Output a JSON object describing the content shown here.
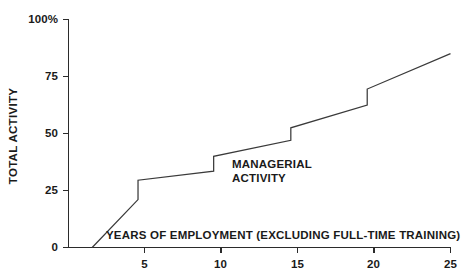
{
  "chart_data": {
    "type": "line",
    "title": "",
    "subtitle": "",
    "xlabel": "YEARS OF EMPLOYMENT (EXCLUDING FULL-TIME TRAINING)",
    "ylabel": "TOTAL ACTIVITY",
    "xlim": [
      0,
      25
    ],
    "ylim": [
      0,
      100
    ],
    "grid": false,
    "legend_position": "none",
    "x_ticks": [
      5,
      10,
      15,
      20,
      25
    ],
    "x_tick_labels": [
      "5",
      "10",
      "15",
      "20",
      "25"
    ],
    "y_ticks": [
      0,
      25,
      50,
      75,
      100
    ],
    "y_tick_labels": [
      "0",
      "25",
      "50",
      "75",
      "100%"
    ],
    "annotations": [
      {
        "name": "managerial-activity",
        "line1": "MANAGERIAL",
        "line2": "ACTIVITY",
        "x": 13.1,
        "y": 39
      }
    ],
    "series": [
      {
        "name": "Total activity step curve",
        "style": "step-with-ramps",
        "color": "#3a3a3a",
        "points": [
          {
            "x": 1.55,
            "y": 0
          },
          {
            "x": 4.55,
            "y": 21
          },
          {
            "x": 4.55,
            "y": 29.5
          },
          {
            "x": 9.5,
            "y": 33.5
          },
          {
            "x": 9.5,
            "y": 40
          },
          {
            "x": 14.55,
            "y": 47
          },
          {
            "x": 14.55,
            "y": 52.5
          },
          {
            "x": 19.55,
            "y": 62.5
          },
          {
            "x": 19.55,
            "y": 69.5
          },
          {
            "x": 25.0,
            "y": 85
          }
        ]
      }
    ]
  },
  "axis": {
    "y_labels": [
      "100%",
      "75",
      "50",
      "25",
      "0"
    ],
    "x_labels": [
      "5",
      "10",
      "15",
      "20",
      "25"
    ],
    "y_title": "TOTAL ACTIVITY",
    "x_title": "YEARS OF EMPLOYMENT (EXCLUDING FULL-TIME TRAINING)"
  },
  "annotation": {
    "line1": "MANAGERIAL",
    "line2": "ACTIVITY"
  },
  "colors": {
    "line": "#3a3a3a",
    "axis": "#2b2b2b",
    "text": "#1a1a1a",
    "background": "#ffffff"
  }
}
